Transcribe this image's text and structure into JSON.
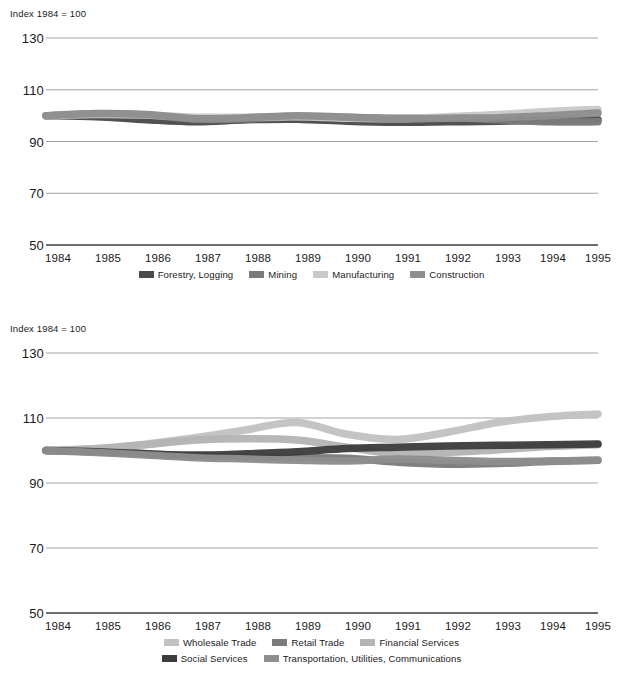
{
  "charts": [
    {
      "id": "chart-1",
      "axis_note": "Index 1984 = 100",
      "yticks": [
        "130",
        "110",
        "90",
        "70",
        "50"
      ],
      "xticks": [
        "1984",
        "1985",
        "1986",
        "1987",
        "1988",
        "1989",
        "1990",
        "1991",
        "1992",
        "1993",
        "1994",
        "1995"
      ],
      "legend": [
        {
          "label": "Forestry, Logging",
          "color": "#4a4a4a"
        },
        {
          "label": "Mining",
          "color": "#7b7b7b"
        },
        {
          "label": "Manufacturing",
          "color": "#c9c9c9"
        },
        {
          "label": "Construction",
          "color": "#8e8e8e"
        }
      ]
    },
    {
      "id": "chart-2",
      "axis_note": "Index  1984 = 100",
      "yticks": [
        "130",
        "110",
        "90",
        "70",
        "50"
      ],
      "xticks": [
        "1984",
        "1985",
        "1986",
        "1987",
        "1988",
        "1989",
        "1990",
        "1991",
        "1992",
        "1993",
        "1994",
        "1995"
      ],
      "legend_row_1": [
        {
          "label": "Wholesale Trade",
          "color": "#c2c2c2"
        },
        {
          "label": "Retail Trade",
          "color": "#7b7b7b"
        },
        {
          "label": "Financial Services",
          "color": "#b4b4b4"
        }
      ],
      "legend_row_2": [
        {
          "label": "Social Services",
          "color": "#3d3d3d"
        },
        {
          "label": "Transportation, Utilities, Communications",
          "color": "#8e8e8e"
        }
      ]
    }
  ],
  "footnote": "",
  "chart_data": [
    {
      "type": "line",
      "title": "",
      "subtitle": "Index 1984 = 100",
      "xlabel": "",
      "ylabel": "Index 1984 = 100",
      "x": [
        1984,
        1985,
        1986,
        1987,
        1988,
        1989,
        1990,
        1991,
        1992,
        1993,
        1994,
        1995
      ],
      "categories": [
        "1984",
        "1985",
        "1986",
        "1987",
        "1988",
        "1989",
        "1990",
        "1991",
        "1992",
        "1993",
        "1994",
        "1995"
      ],
      "ylim": [
        50,
        130
      ],
      "yticks": [
        50,
        70,
        90,
        110,
        130
      ],
      "grid": true,
      "legend_position": "bottom",
      "series": [
        {
          "name": "Forestry, Logging",
          "color": "#4a4a4a",
          "values": [
            100,
            99.6,
            98.4,
            97.6,
            98.4,
            98.6,
            97.8,
            97.4,
            97.6,
            97.8,
            98.2,
            98.4
          ]
        },
        {
          "name": "Mining",
          "color": "#7b7b7b",
          "values": [
            100,
            100.6,
            100.2,
            98.6,
            98.8,
            99.6,
            99.4,
            99.0,
            99.2,
            98.4,
            97.6,
            97.6
          ]
        },
        {
          "name": "Manufacturing",
          "color": "#c9c9c9",
          "values": [
            100,
            100.4,
            100.2,
            99.4,
            99.4,
            99.6,
            99.0,
            98.8,
            99.6,
            100.4,
            101.6,
            102.4
          ]
        },
        {
          "name": "Construction",
          "color": "#8e8e8e",
          "values": [
            100,
            100.8,
            100.4,
            98.8,
            99.2,
            100.0,
            99.4,
            98.8,
            99.0,
            99.2,
            100.0,
            101.0
          ]
        }
      ]
    },
    {
      "type": "line",
      "title": "",
      "subtitle": "Index  1984 = 100",
      "xlabel": "",
      "ylabel": "Index 1984 = 100",
      "x": [
        1984,
        1985,
        1986,
        1987,
        1988,
        1989,
        1990,
        1991,
        1992,
        1993,
        1994,
        1995
      ],
      "categories": [
        "1984",
        "1985",
        "1986",
        "1987",
        "1988",
        "1989",
        "1990",
        "1991",
        "1992",
        "1993",
        "1994",
        "1995"
      ],
      "ylim": [
        50,
        130
      ],
      "yticks": [
        50,
        70,
        90,
        110,
        130
      ],
      "grid": true,
      "legend_position": "bottom",
      "series": [
        {
          "name": "Wholesale Trade",
          "color": "#c2c2c2",
          "values": [
            100,
            100.4,
            102.0,
            104.0,
            106.4,
            108.6,
            105.0,
            103.4,
            105.6,
            108.6,
            110.4,
            111.2
          ]
        },
        {
          "name": "Retail Trade",
          "color": "#7b7b7b",
          "values": [
            100,
            99.8,
            99.0,
            98.2,
            98.0,
            97.8,
            97.6,
            96.4,
            95.8,
            96.0,
            96.6,
            97.0
          ]
        },
        {
          "name": "Financial Services",
          "color": "#b4b4b4",
          "values": [
            100,
            100.6,
            101.8,
            103.2,
            103.6,
            103.2,
            101.0,
            99.0,
            99.4,
            100.2,
            101.2,
            101.8
          ]
        },
        {
          "name": "Social Services",
          "color": "#3d3d3d",
          "values": [
            100,
            99.6,
            99.0,
            98.6,
            99.0,
            99.6,
            100.6,
            101.0,
            101.4,
            101.6,
            101.8,
            102.0
          ]
        },
        {
          "name": "Transportation, Utilities, Communications",
          "color": "#8e8e8e",
          "values": [
            100,
            99.4,
            98.6,
            97.8,
            97.4,
            97.0,
            96.8,
            97.4,
            97.0,
            96.6,
            96.8,
            97.0
          ]
        }
      ]
    }
  ]
}
